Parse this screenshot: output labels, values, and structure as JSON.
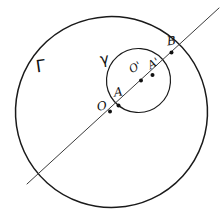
{
  "figure": {
    "background_color": "#ffffff",
    "ink_color": "#1a1a1a"
  },
  "curves": {
    "major_circle": {
      "label": "Γ",
      "label_name": "gamma-uppercase",
      "cx": 111.5,
      "cy": 112.0,
      "rx": 96.0,
      "ry": 95.5,
      "stroke": "#1a1a1a"
    },
    "minor_circle": {
      "label": "γ",
      "label_name": "gamma-lowercase",
      "cx": 138.5,
      "cy": 80.5,
      "rx": 32.0,
      "ry": 32.0,
      "stroke": "#1a1a1a"
    }
  },
  "secant": {
    "name": "secant-line",
    "x1": 27.0,
    "y1": 184.0,
    "x2": 219.0,
    "y2": 8.0,
    "stroke": "#3a3a3a"
  },
  "points": [
    {
      "id": "O",
      "label": "O",
      "x": 110.0,
      "y": 111.5,
      "label_x": 97,
      "label_y": 100,
      "radius": 2.0
    },
    {
      "id": "A",
      "label": "A",
      "x": 118.5,
      "y": 105.5,
      "label_x": 114,
      "label_y": 86,
      "radius": 2.0
    },
    {
      "id": "Op",
      "label": "O'",
      "x": 141.0,
      "y": 80.5,
      "label_x": 129,
      "label_y": 62,
      "radius": 2.0
    },
    {
      "id": "Ap",
      "label": "A'",
      "x": 152.5,
      "y": 75.0,
      "label_x": 148,
      "label_y": 58,
      "radius": 2.0
    },
    {
      "id": "B",
      "label": "B",
      "x": 171.5,
      "y": 52.5,
      "label_x": 167,
      "label_y": 35,
      "radius": 2.0
    }
  ]
}
